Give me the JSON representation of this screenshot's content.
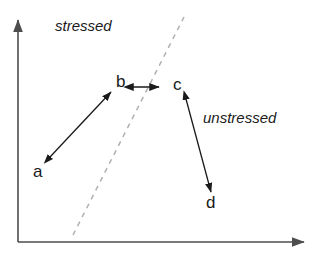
{
  "figure": {
    "type": "schematic-diagram",
    "background_color": "#ffffff",
    "width": 319,
    "height": 255,
    "axis_color": "#4d4d4d",
    "arrow_color": "#1a1a1a",
    "dashed_line_color": "#b0b0b0",
    "text_color": "#1a1a1a"
  },
  "axes": {
    "x_axis": {
      "name": "x-axis",
      "from": [
        18,
        242
      ],
      "to": [
        307,
        242
      ],
      "has_arrowhead": true,
      "label": ""
    },
    "y_axis": {
      "name": "y-axis",
      "from": [
        18,
        242
      ],
      "to": [
        18,
        17
      ],
      "has_arrowhead": true,
      "label": ""
    }
  },
  "regions": [
    {
      "id": "stressed",
      "label": "stressed",
      "x": 55,
      "y": 18,
      "style": "italic"
    },
    {
      "id": "unstressed",
      "label": "unstressed",
      "x": 203,
      "y": 110,
      "style": "italic"
    }
  ],
  "nodes": [
    {
      "id": "a",
      "label": "a",
      "x": 33,
      "y": 163
    },
    {
      "id": "b",
      "label": "b",
      "x": 116,
      "y": 73
    },
    {
      "id": "c",
      "label": "c",
      "x": 173,
      "y": 76
    },
    {
      "id": "d",
      "label": "d",
      "x": 206,
      "y": 194
    }
  ],
  "arrows": [
    {
      "id": "arrow-a-b",
      "from_node": "a",
      "to_node": "b",
      "from": [
        50,
        157
      ],
      "to": [
        111,
        92
      ],
      "double_headed": true
    },
    {
      "id": "arrow-b-c",
      "from_node": "b",
      "to_node": "c",
      "from": [
        132,
        87
      ],
      "to": [
        160,
        87
      ],
      "double_headed": true
    },
    {
      "id": "arrow-c-d",
      "from_node": "c",
      "to_node": "d",
      "from": [
        186,
        99
      ],
      "to": [
        211,
        192
      ],
      "double_headed": true
    }
  ],
  "dashed_line": {
    "id": "boundary-line",
    "from": [
      73,
      235
    ],
    "to": [
      184,
      17
    ],
    "dash_pattern": "5 5",
    "color": "#b0b0b0"
  }
}
